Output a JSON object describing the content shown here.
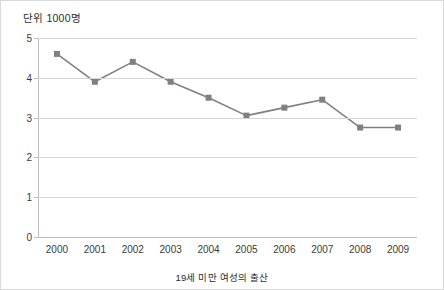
{
  "chart_data": {
    "type": "line",
    "title": "단위 1000명",
    "caption": "19세 미만 여성의 출산",
    "xlabel": "",
    "ylabel": "",
    "categories": [
      "2000",
      "2001",
      "2002",
      "2003",
      "2004",
      "2005",
      "2006",
      "2007",
      "2008",
      "2009"
    ],
    "values": [
      4.6,
      3.9,
      4.4,
      3.9,
      3.5,
      3.05,
      3.25,
      3.45,
      2.75,
      2.75
    ],
    "series": [
      {
        "name": "19세 미만 여성의 출산",
        "values": [
          4.6,
          3.9,
          4.4,
          3.9,
          3.5,
          3.05,
          3.25,
          3.45,
          2.75,
          2.75
        ]
      }
    ],
    "ylim": [
      0,
      5
    ],
    "y_ticks": [
      "0",
      "1",
      "2",
      "3",
      "4",
      "5"
    ],
    "grid": true,
    "legend": "none",
    "marker": "square",
    "series_color": "#808080",
    "grid_color": "#d6d6d6",
    "axis_color": "#bdbdbd"
  }
}
